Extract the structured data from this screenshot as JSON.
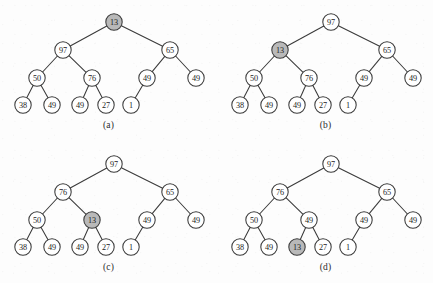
{
  "figure": {
    "panel_count": 4,
    "node_fill_default": "#ffffff",
    "node_fill_highlight": "#b9b9b9",
    "stroke_color": "#3a3a3a",
    "background": "#fdfdfd"
  },
  "layout": {
    "panel_width": 217,
    "panel_height": 142,
    "levels_y": [
      22,
      50,
      78,
      105
    ],
    "caption_y_offset": 120
  },
  "panels": [
    {
      "id": "panel-a",
      "caption": "(a)",
      "origin_x": 0,
      "origin_y": 0,
      "nodes": [
        {
          "id": "a-root",
          "label": "13",
          "x": 114,
          "y": 22,
          "highlight": true
        },
        {
          "id": "a-n1",
          "label": "97",
          "x": 63,
          "y": 50,
          "highlight": false
        },
        {
          "id": "a-n2",
          "label": "65",
          "x": 170,
          "y": 50,
          "highlight": false
        },
        {
          "id": "a-n3",
          "label": "50",
          "x": 37,
          "y": 78,
          "highlight": false
        },
        {
          "id": "a-n4",
          "label": "76",
          "x": 92,
          "y": 78,
          "highlight": false
        },
        {
          "id": "a-n5",
          "label": "49",
          "x": 147,
          "y": 78,
          "highlight": false
        },
        {
          "id": "a-n6",
          "label": "49",
          "x": 196,
          "y": 78,
          "highlight": false
        },
        {
          "id": "a-n7",
          "label": "38",
          "x": 23,
          "y": 105,
          "highlight": false
        },
        {
          "id": "a-n8",
          "label": "49",
          "x": 52,
          "y": 105,
          "highlight": false
        },
        {
          "id": "a-n9",
          "label": "49",
          "x": 80,
          "y": 105,
          "highlight": false
        },
        {
          "id": "a-n10",
          "label": "27",
          "x": 106,
          "y": 105,
          "highlight": false
        },
        {
          "id": "a-n11",
          "label": "1",
          "x": 131,
          "y": 105,
          "highlight": false
        }
      ],
      "edges": [
        [
          "a-root",
          "a-n1"
        ],
        [
          "a-root",
          "a-n2"
        ],
        [
          "a-n1",
          "a-n3"
        ],
        [
          "a-n1",
          "a-n4"
        ],
        [
          "a-n2",
          "a-n5"
        ],
        [
          "a-n2",
          "a-n6"
        ],
        [
          "a-n3",
          "a-n7"
        ],
        [
          "a-n3",
          "a-n8"
        ],
        [
          "a-n4",
          "a-n9"
        ],
        [
          "a-n4",
          "a-n10"
        ],
        [
          "a-n5",
          "a-n11"
        ]
      ]
    },
    {
      "id": "panel-b",
      "caption": "(b)",
      "origin_x": 217,
      "origin_y": 0,
      "nodes": [
        {
          "id": "b-root",
          "label": "97",
          "x": 114,
          "y": 22,
          "highlight": false
        },
        {
          "id": "b-n1",
          "label": "13",
          "x": 63,
          "y": 50,
          "highlight": true
        },
        {
          "id": "b-n2",
          "label": "65",
          "x": 170,
          "y": 50,
          "highlight": false
        },
        {
          "id": "b-n3",
          "label": "50",
          "x": 37,
          "y": 78,
          "highlight": false
        },
        {
          "id": "b-n4",
          "label": "76",
          "x": 92,
          "y": 78,
          "highlight": false
        },
        {
          "id": "b-n5",
          "label": "49",
          "x": 147,
          "y": 78,
          "highlight": false
        },
        {
          "id": "b-n6",
          "label": "49",
          "x": 196,
          "y": 78,
          "highlight": false
        },
        {
          "id": "b-n7",
          "label": "38",
          "x": 23,
          "y": 105,
          "highlight": false
        },
        {
          "id": "b-n8",
          "label": "49",
          "x": 52,
          "y": 105,
          "highlight": false
        },
        {
          "id": "b-n9",
          "label": "49",
          "x": 80,
          "y": 105,
          "highlight": false
        },
        {
          "id": "b-n10",
          "label": "27",
          "x": 106,
          "y": 105,
          "highlight": false
        },
        {
          "id": "b-n11",
          "label": "1",
          "x": 131,
          "y": 105,
          "highlight": false
        }
      ],
      "edges": [
        [
          "b-root",
          "b-n1"
        ],
        [
          "b-root",
          "b-n2"
        ],
        [
          "b-n1",
          "b-n3"
        ],
        [
          "b-n1",
          "b-n4"
        ],
        [
          "b-n2",
          "b-n5"
        ],
        [
          "b-n2",
          "b-n6"
        ],
        [
          "b-n3",
          "b-n7"
        ],
        [
          "b-n3",
          "b-n8"
        ],
        [
          "b-n4",
          "b-n9"
        ],
        [
          "b-n4",
          "b-n10"
        ],
        [
          "b-n5",
          "b-n11"
        ]
      ]
    },
    {
      "id": "panel-c",
      "caption": "(c)",
      "origin_x": 0,
      "origin_y": 142,
      "nodes": [
        {
          "id": "c-root",
          "label": "97",
          "x": 114,
          "y": 22,
          "highlight": false
        },
        {
          "id": "c-n1",
          "label": "76",
          "x": 63,
          "y": 50,
          "highlight": false
        },
        {
          "id": "c-n2",
          "label": "65",
          "x": 170,
          "y": 50,
          "highlight": false
        },
        {
          "id": "c-n3",
          "label": "50",
          "x": 37,
          "y": 78,
          "highlight": false
        },
        {
          "id": "c-n4",
          "label": "13",
          "x": 92,
          "y": 78,
          "highlight": true
        },
        {
          "id": "c-n5",
          "label": "49",
          "x": 147,
          "y": 78,
          "highlight": false
        },
        {
          "id": "c-n6",
          "label": "49",
          "x": 196,
          "y": 78,
          "highlight": false
        },
        {
          "id": "c-n7",
          "label": "38",
          "x": 23,
          "y": 105,
          "highlight": false
        },
        {
          "id": "c-n8",
          "label": "49",
          "x": 52,
          "y": 105,
          "highlight": false
        },
        {
          "id": "c-n9",
          "label": "49",
          "x": 80,
          "y": 105,
          "highlight": false
        },
        {
          "id": "c-n10",
          "label": "27",
          "x": 106,
          "y": 105,
          "highlight": false
        },
        {
          "id": "c-n11",
          "label": "1",
          "x": 131,
          "y": 105,
          "highlight": false
        }
      ],
      "edges": [
        [
          "c-root",
          "c-n1"
        ],
        [
          "c-root",
          "c-n2"
        ],
        [
          "c-n1",
          "c-n3"
        ],
        [
          "c-n1",
          "c-n4"
        ],
        [
          "c-n2",
          "c-n5"
        ],
        [
          "c-n2",
          "c-n6"
        ],
        [
          "c-n3",
          "c-n7"
        ],
        [
          "c-n3",
          "c-n8"
        ],
        [
          "c-n4",
          "c-n9"
        ],
        [
          "c-n4",
          "c-n10"
        ],
        [
          "c-n5",
          "c-n11"
        ]
      ]
    },
    {
      "id": "panel-d",
      "caption": "(d)",
      "origin_x": 217,
      "origin_y": 142,
      "nodes": [
        {
          "id": "d-root",
          "label": "97",
          "x": 114,
          "y": 22,
          "highlight": false
        },
        {
          "id": "d-n1",
          "label": "76",
          "x": 63,
          "y": 50,
          "highlight": false
        },
        {
          "id": "d-n2",
          "label": "65",
          "x": 170,
          "y": 50,
          "highlight": false
        },
        {
          "id": "d-n3",
          "label": "50",
          "x": 37,
          "y": 78,
          "highlight": false
        },
        {
          "id": "d-n4",
          "label": "49",
          "x": 92,
          "y": 78,
          "highlight": false
        },
        {
          "id": "d-n5",
          "label": "49",
          "x": 147,
          "y": 78,
          "highlight": false
        },
        {
          "id": "d-n6",
          "label": "49",
          "x": 196,
          "y": 78,
          "highlight": false
        },
        {
          "id": "d-n7",
          "label": "38",
          "x": 23,
          "y": 105,
          "highlight": false
        },
        {
          "id": "d-n8",
          "label": "49",
          "x": 52,
          "y": 105,
          "highlight": false
        },
        {
          "id": "d-n9",
          "label": "13",
          "x": 80,
          "y": 105,
          "highlight": true
        },
        {
          "id": "d-n10",
          "label": "27",
          "x": 106,
          "y": 105,
          "highlight": false
        },
        {
          "id": "d-n11",
          "label": "1",
          "x": 131,
          "y": 105,
          "highlight": false
        }
      ],
      "edges": [
        [
          "d-root",
          "d-n1"
        ],
        [
          "d-root",
          "d-n2"
        ],
        [
          "d-n1",
          "d-n3"
        ],
        [
          "d-n1",
          "d-n4"
        ],
        [
          "d-n2",
          "d-n5"
        ],
        [
          "d-n2",
          "d-n6"
        ],
        [
          "d-n3",
          "d-n7"
        ],
        [
          "d-n3",
          "d-n8"
        ],
        [
          "d-n4",
          "d-n9"
        ],
        [
          "d-n4",
          "d-n10"
        ],
        [
          "d-n5",
          "d-n11"
        ]
      ]
    }
  ]
}
